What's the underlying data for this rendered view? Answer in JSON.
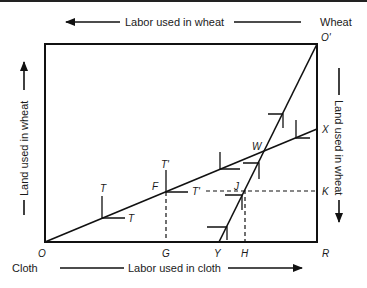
{
  "figure": {
    "type": "edgeworth-box",
    "axis_labels": {
      "top": "Labor used in wheat",
      "bottom": "Labor used in cloth",
      "left": "Land used in wheat",
      "right": "Land used in wheat"
    },
    "corner_labels": {
      "wheat": "Wheat",
      "cloth": "Cloth"
    },
    "points": {
      "O": "O",
      "O_prime": "O'",
      "R": "R",
      "G": "G",
      "Y": "Y",
      "H": "H",
      "X": "X",
      "K": "K",
      "W": "W",
      "F": "F",
      "J": "J",
      "T1": "T",
      "T2": "T",
      "T_prime_1": "T'",
      "T_prime_2": "T'"
    },
    "lines": [
      {
        "name": "cloth-expansion-path",
        "from": "O",
        "to": "X"
      },
      {
        "name": "wheat-expansion-path",
        "from": "Y",
        "to": "O'"
      },
      {
        "name": "dashed-FG",
        "from": "F",
        "to": "G"
      },
      {
        "name": "dashed-JH",
        "from": "J",
        "to": "H"
      },
      {
        "name": "dashed-T'K",
        "from": "T'",
        "to": "K"
      }
    ],
    "colors": {
      "ink": "#111111",
      "background": "#ffffff"
    }
  }
}
